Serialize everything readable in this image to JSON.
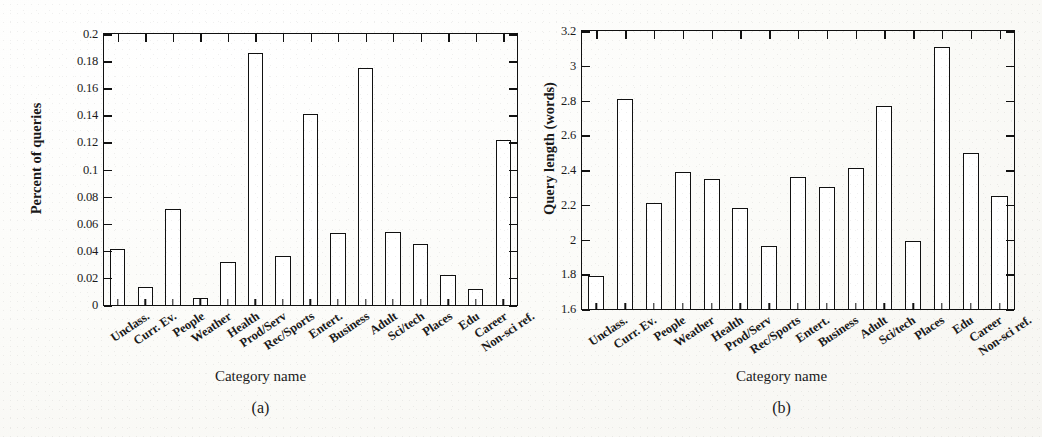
{
  "figure": {
    "panels": [
      "(a)",
      "(b)"
    ]
  },
  "chart_data": [
    {
      "type": "bar",
      "panel": "(a)",
      "title": "",
      "xlabel": "Category name",
      "ylabel": "Percent of queries",
      "ylim": [
        0,
        0.2
      ],
      "ytick_labels": [
        "0",
        "0.02",
        "0.04",
        "0.06",
        "0.08",
        "0.1",
        "0.12",
        "0.14",
        "0.16",
        "0.18",
        "0.2"
      ],
      "ytick_values": [
        0,
        0.02,
        0.04,
        0.06,
        0.08,
        0.1,
        0.12,
        0.14,
        0.16,
        0.18,
        0.2
      ],
      "grid": false,
      "legend": "none",
      "categories": [
        "Unclass.",
        "Curr. Ev.",
        "People",
        "Weather",
        "Health",
        "Prod/Serv",
        "Rec/Sports",
        "Entert.",
        "Business",
        "Adult",
        "Sci/tech",
        "Places",
        "Edu",
        "Career",
        "Non-sci ref."
      ],
      "values": [
        0.041,
        0.013,
        0.071,
        0.005,
        0.032,
        0.186,
        0.036,
        0.141,
        0.053,
        0.175,
        0.054,
        0.045,
        0.022,
        0.012,
        0.122
      ]
    },
    {
      "type": "bar",
      "panel": "(b)",
      "title": "",
      "xlabel": "Category name",
      "ylabel": "Query length (words)",
      "ylim": [
        1.6,
        3.2
      ],
      "ytick_labels": [
        "1.6",
        "1.8",
        "2",
        "2.2",
        "2.4",
        "2.6",
        "2.8",
        "3",
        "3.2"
      ],
      "ytick_values": [
        1.6,
        1.8,
        2.0,
        2.2,
        2.4,
        2.6,
        2.8,
        3.0,
        3.2
      ],
      "grid": false,
      "legend": "none",
      "categories": [
        "Unclass.",
        "Curr. Ev.",
        "People",
        "Weather",
        "Health",
        "Prod/Serv",
        "Rec/Sports",
        "Entert.",
        "Business",
        "Adult",
        "Sci/tech",
        "Places",
        "Edu",
        "Career",
        "Non-sci ref."
      ],
      "values": [
        1.79,
        2.81,
        2.21,
        2.39,
        2.35,
        2.18,
        1.96,
        2.36,
        2.3,
        2.41,
        2.77,
        1.99,
        3.11,
        2.5,
        2.25
      ]
    }
  ]
}
